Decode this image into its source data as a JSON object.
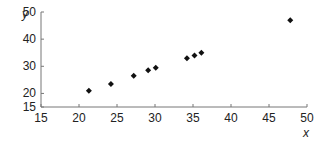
{
  "chart_data": {
    "type": "scatter",
    "title": "",
    "xlabel": "x",
    "ylabel": "y",
    "xlim": [
      15,
      50
    ],
    "ylim": [
      15,
      50
    ],
    "x_ticks": [
      15,
      20,
      25,
      30,
      35,
      40,
      45,
      50
    ],
    "y_ticks": [
      15,
      20,
      30,
      40,
      50
    ],
    "grid": false,
    "legend": null,
    "marker": "diamond",
    "color": "#111111",
    "points": [
      {
        "x": 21.3,
        "y": 21.0
      },
      {
        "x": 24.2,
        "y": 23.5
      },
      {
        "x": 27.2,
        "y": 26.5
      },
      {
        "x": 29.1,
        "y": 28.5
      },
      {
        "x": 30.1,
        "y": 29.5
      },
      {
        "x": 34.2,
        "y": 33.0
      },
      {
        "x": 35.2,
        "y": 34.0
      },
      {
        "x": 36.1,
        "y": 35.0
      },
      {
        "x": 47.8,
        "y": 47.0
      }
    ]
  }
}
